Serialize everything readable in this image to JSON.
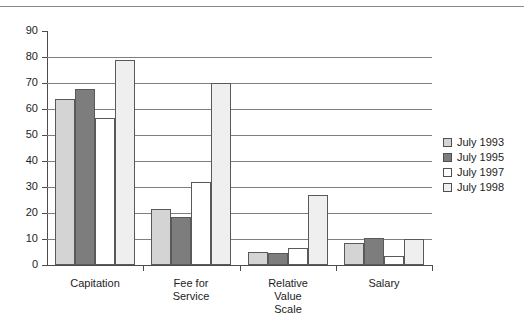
{
  "chart_data": {
    "type": "bar",
    "title": "",
    "xlabel": "",
    "ylabel": "",
    "ylim": [
      0,
      90
    ],
    "ytick_step": 10,
    "grid": true,
    "legend_position": "right",
    "categories": [
      "Capitation",
      "Fee for\nService",
      "Relative\nValue\nScale",
      "Salary"
    ],
    "series": [
      {
        "name": "July 1993",
        "color": "#d4d4d4",
        "values": [
          64,
          21.5,
          5,
          8.5
        ]
      },
      {
        "name": "July 1995",
        "color": "#7d7d7d",
        "values": [
          67.5,
          18.5,
          4.5,
          10.5
        ]
      },
      {
        "name": "July 1997",
        "color": "#ffffff",
        "values": [
          56.5,
          32,
          6.5,
          3.5
        ]
      },
      {
        "name": "July 1998",
        "color": "#efefef",
        "values": [
          79,
          70,
          27,
          10
        ]
      }
    ],
    "ytick_labels": [
      "90",
      "80",
      "70",
      "60",
      "50",
      "40",
      "30",
      "20",
      "10",
      "0"
    ]
  },
  "legend": {
    "items": [
      {
        "label": "July 1993",
        "swatch_name": "legend-swatch-july-1993"
      },
      {
        "label": "July 1995",
        "swatch_name": "legend-swatch-july-1995"
      },
      {
        "label": "July 1997",
        "swatch_name": "legend-swatch-july-1997"
      },
      {
        "label": "July 1998",
        "swatch_name": "legend-swatch-july-1998"
      }
    ]
  },
  "axis": {
    "y_ticks": [
      "90",
      "80",
      "70",
      "60",
      "50",
      "40",
      "30",
      "20",
      "10",
      "0"
    ],
    "x_categories": [
      "Capitation",
      "Fee for\nService",
      "Relative\nValue\nScale",
      "Salary"
    ]
  },
  "colors": {
    "series_1": "#d4d4d4",
    "series_2": "#7d7d7d",
    "series_3": "#ffffff",
    "series_4": "#efefef",
    "gridline": "#7d7f81",
    "axis": "#4a4c4e",
    "text": "#1d1d1d"
  }
}
